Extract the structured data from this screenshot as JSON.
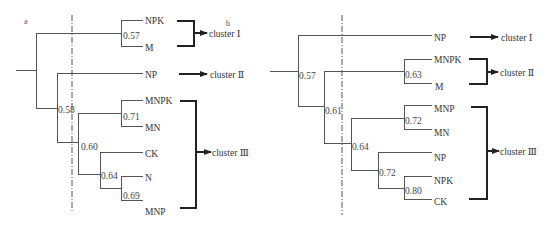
{
  "panels": [
    {
      "label": "a",
      "leaves": [
        "NPK",
        "M",
        "NP",
        "MNPK",
        "MN",
        "CK",
        "N",
        "MNP"
      ],
      "node_values": {
        "npk_m": "0.57",
        "np_rest": "0.58",
        "mnpk_mn": "0.71",
        "inner": "0.60",
        "ck_n_mnp": "0.64",
        "n_mnp": "0.69"
      },
      "clusters": [
        {
          "name": "cluster Ⅰ",
          "members": [
            "NPK",
            "M"
          ]
        },
        {
          "name": "cluster Ⅱ",
          "members": [
            "NP"
          ]
        },
        {
          "name": "cluster Ⅲ",
          "members": [
            "MNPK",
            "MN",
            "CK",
            "N",
            "MNP"
          ]
        }
      ]
    },
    {
      "label": "b",
      "leaves": [
        "NP",
        "MNPK",
        "M",
        "MNP",
        "MN",
        "NP",
        "NPK",
        "CK"
      ],
      "node_values": {
        "root": "0.57",
        "mnpk_m": "0.63",
        "rest": "0.61",
        "mnp_mn": "0.72",
        "inner": "0.64",
        "np_npk_ck": "0.72",
        "npk_ck": "0.80"
      },
      "clusters": [
        {
          "name": "cluster Ⅰ",
          "members": [
            "NP"
          ]
        },
        {
          "name": "cluster Ⅱ",
          "members": [
            "MNPK",
            "M"
          ]
        },
        {
          "name": "cluster Ⅲ",
          "members": [
            "MNP",
            "MN",
            "NP",
            "NPK",
            "CK"
          ]
        }
      ]
    }
  ]
}
